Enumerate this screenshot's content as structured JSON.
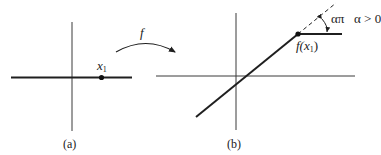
{
  "figure": {
    "mapping_label": "f",
    "panel_a": {
      "caption": "(a)",
      "point_label_main": "x",
      "point_label_sub": "1"
    },
    "panel_b": {
      "caption": "(b)",
      "point_label_prefix": "f(",
      "point_label_var": "x",
      "point_label_sub": "1",
      "point_label_suffix": ")",
      "angle_label": "απ",
      "condition_label": "α > 0"
    },
    "colors": {
      "line": "#1f1f1f",
      "axis": "#3a3a3a",
      "background": "#ffffff"
    }
  }
}
